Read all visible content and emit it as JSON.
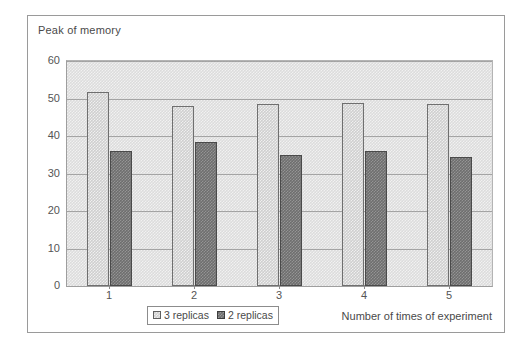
{
  "figure": {
    "title": "Peak of memory"
  },
  "chart_data": {
    "type": "bar",
    "title": "Peak of memory",
    "xlabel": "Number of times of experiment",
    "ylabel": "",
    "categories": [
      "1",
      "2",
      "3",
      "4",
      "5"
    ],
    "series": [
      {
        "name": "3 replicas",
        "values": [
          51.7,
          48.0,
          48.6,
          48.8,
          48.4
        ],
        "color": "#cfcfcf"
      },
      {
        "name": "2 replicas",
        "values": [
          36.1,
          38.5,
          34.9,
          35.9,
          34.5
        ],
        "color": "#6e6e6e"
      }
    ],
    "ylim": [
      0,
      60
    ],
    "yticks": [
      0,
      10,
      20,
      30,
      40,
      50,
      60
    ],
    "ytick_labels": [
      "0",
      "10",
      "20",
      "30",
      "40",
      "50",
      "60"
    ],
    "grid": true,
    "grid_axis": "y",
    "legend_position": "bottom-center",
    "legend_entries": [
      "3 replicas",
      "2 replicas"
    ]
  },
  "legend": {
    "entry_a_label": "3 replicas",
    "entry_b_label": "2 replicas",
    "swatch_a_icon": "legend-swatch-light-icon",
    "swatch_b_icon": "legend-swatch-dark-icon"
  },
  "axes": {
    "x_title": "Number of times of experiment"
  }
}
